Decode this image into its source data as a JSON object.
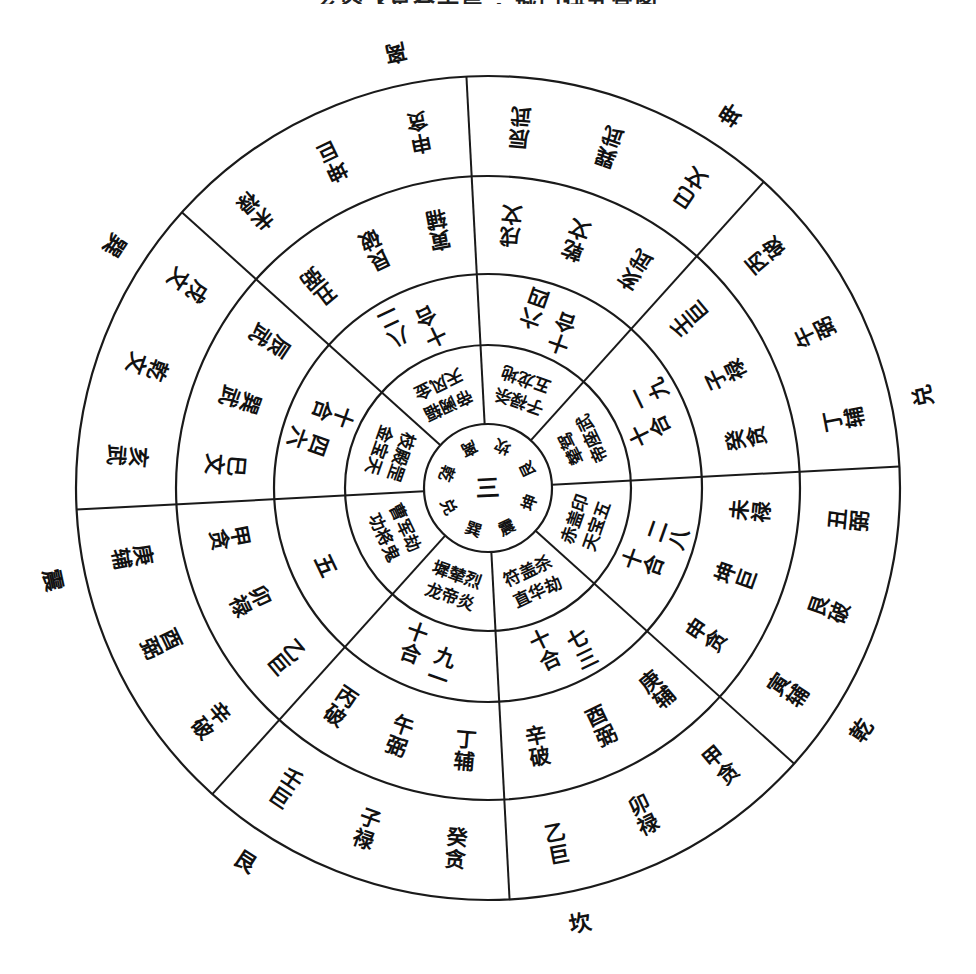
{
  "title": "玄空飞星合十局 · 城门诀九宫图",
  "diagram": {
    "center_text": "三",
    "center_ring": [
      "离",
      "坎",
      "艮",
      "坤",
      "震",
      "巽",
      "兑",
      "乾"
    ],
    "outer_labels": [
      "离",
      "坤",
      "兑",
      "乾",
      "坎",
      "艮",
      "震",
      "巽"
    ],
    "sectors": [
      {
        "outer_label": "离",
        "outer_ring": [
          "未禄",
          "坤巨",
          "申贪"
        ],
        "middle_ring": [
          "丑弼",
          "艮破",
          "寅辅"
        ],
        "he_shi": "八二十合",
        "inner_ring": [
          "天风金",
          "帝阙辐"
        ]
      },
      {
        "outer_label": "坤",
        "outer_ring": [
          "辰武",
          "巽武",
          "巳文"
        ],
        "middle_ring": [
          "戌文",
          "乾文",
          "亥武"
        ],
        "he_shi": "六四十合",
        "inner_ring": [
          "五龙地",
          "子禄杀"
        ]
      },
      {
        "outer_label": "兑",
        "outer_ring": [
          "丙破",
          "午弼",
          "丁辅"
        ],
        "middle_ring": [
          "壬巨",
          "子禄",
          "癸贪"
        ],
        "he_shi": "一九十合",
        "inner_ring": [
          "帝座武",
          "辇驾"
        ]
      },
      {
        "outer_label": "乾",
        "outer_ring": [
          "丑弼",
          "艮破",
          "寅辅"
        ],
        "middle_ring": [
          "未禄",
          "坤巨",
          "申贪"
        ],
        "he_shi": "二八十合",
        "inner_ring": [
          "天宝五",
          "赤盖印"
        ]
      },
      {
        "outer_label": "坎",
        "outer_ring": [
          "甲贪",
          "卯禄",
          "乙巨"
        ],
        "middle_ring": [
          "庚辅",
          "酉弼",
          "辛破"
        ],
        "he_shi": "七三十合",
        "inner_ring": [
          "直华劫",
          "符盖杀"
        ]
      },
      {
        "outer_label": "艮",
        "outer_ring": [
          "癸贪",
          "子禄",
          "壬巨"
        ],
        "middle_ring": [
          "丁辅",
          "午弼",
          "丙破"
        ],
        "he_shi": "九一十合",
        "inner_ring": [
          "龙帝炎",
          "墀辇烈"
        ]
      },
      {
        "outer_label": "震",
        "outer_ring": [
          "辛破",
          "酉弼",
          "庚辅"
        ],
        "middle_ring": [
          "乙巨",
          "卯禄",
          "甲贪"
        ],
        "he_shi": "五",
        "inner_ring": [
          "功将鬼",
          "曹军劫"
        ]
      },
      {
        "outer_label": "巽",
        "outer_ring": [
          "亥武",
          "乾文",
          "戌文"
        ],
        "middle_ring": [
          "巳文",
          "巽武",
          "辰武"
        ],
        "he_shi": "四六十合",
        "inner_ring": [
          "金宝天",
          "枝殿罡"
        ]
      }
    ]
  }
}
